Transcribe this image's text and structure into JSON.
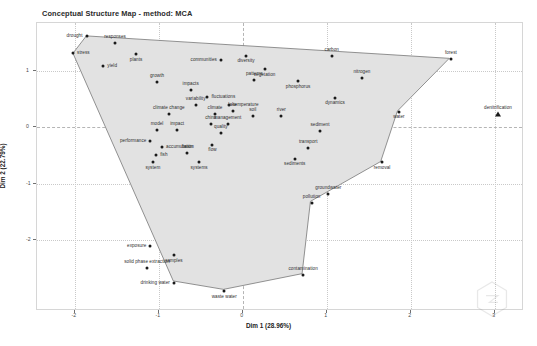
{
  "chart_title": "Conceptual Structure Map - method: MCA",
  "axes": {
    "xlabel": "Dim 1 (28.96%)",
    "ylabel": "Dim 2 (22.79%)",
    "x_ticks": [
      "-2",
      "-1",
      "0",
      "1",
      "2",
      "3"
    ],
    "y_ticks": [
      "1",
      "0",
      "-1",
      "-2"
    ]
  },
  "watermark": "hexagon-logo",
  "chart_data": {
    "type": "scatter",
    "title": "Conceptual Structure Map - method: MCA",
    "xlabel": "Dim 1 (28.96%)",
    "ylabel": "Dim 2 (22.79%)",
    "xlim": [
      -2.45,
      3.35
    ],
    "ylim": [
      -3.25,
      1.85
    ],
    "grid": true,
    "legend": "none",
    "series": [
      {
        "name": "Cluster 1",
        "marker": "circle",
        "points": [
          {
            "label": "drought",
            "x": -1.86,
            "y": 1.62,
            "lpos": "left"
          },
          {
            "label": "responses",
            "x": -1.52,
            "y": 1.5,
            "lpos": "above"
          },
          {
            "label": "stress",
            "x": -2.02,
            "y": 1.31,
            "lpos": "right"
          },
          {
            "label": "plants",
            "x": -1.27,
            "y": 1.3,
            "lpos": "below"
          },
          {
            "label": "yield",
            "x": -1.66,
            "y": 1.09,
            "lpos": "right"
          },
          {
            "label": "communities",
            "x": -0.26,
            "y": 1.19,
            "lpos": "left"
          },
          {
            "label": "diversity",
            "x": 0.04,
            "y": 1.27,
            "lpos": "below"
          },
          {
            "label": "carbon",
            "x": 1.06,
            "y": 1.27,
            "lpos": "above"
          },
          {
            "label": "forest",
            "x": 2.48,
            "y": 1.22,
            "lpos": "above"
          },
          {
            "label": "vegetation",
            "x": 0.26,
            "y": 1.03,
            "lpos": "below"
          },
          {
            "label": "growth",
            "x": -1.02,
            "y": 0.8,
            "lpos": "above"
          },
          {
            "label": "patterns",
            "x": 0.14,
            "y": 0.84,
            "lpos": "above"
          },
          {
            "label": "phosphorus",
            "x": 0.66,
            "y": 0.82,
            "lpos": "below"
          },
          {
            "label": "nitrogen",
            "x": 1.42,
            "y": 0.88,
            "lpos": "above"
          },
          {
            "label": "impacts",
            "x": -0.62,
            "y": 0.66,
            "lpos": "above"
          },
          {
            "label": "fluctuations",
            "x": -0.42,
            "y": 0.54,
            "lpos": "right"
          },
          {
            "label": "dynamics",
            "x": 1.1,
            "y": 0.53,
            "lpos": "below"
          },
          {
            "label": "variability",
            "x": -0.56,
            "y": 0.4,
            "lpos": "above"
          },
          {
            "label": "temperature",
            "x": -0.16,
            "y": 0.4,
            "lpos": "right"
          },
          {
            "label": "water",
            "x": 1.86,
            "y": 0.28,
            "lpos": "below"
          },
          {
            "label": "climate change",
            "x": -0.88,
            "y": 0.24,
            "lpos": "above"
          },
          {
            "label": "climate",
            "x": -0.33,
            "y": 0.24,
            "lpos": "above"
          },
          {
            "label": "lake",
            "x": -0.12,
            "y": 0.29,
            "lpos": "above"
          },
          {
            "label": "soil",
            "x": 0.12,
            "y": 0.21,
            "lpos": "above"
          },
          {
            "label": "river",
            "x": 0.46,
            "y": 0.2,
            "lpos": "above"
          },
          {
            "label": "china",
            "x": -0.38,
            "y": 0.06,
            "lpos": "above"
          },
          {
            "label": "management",
            "x": -0.18,
            "y": 0.07,
            "lpos": "above"
          },
          {
            "label": "model",
            "x": -1.02,
            "y": -0.05,
            "lpos": "above"
          },
          {
            "label": "impact",
            "x": -0.78,
            "y": -0.05,
            "lpos": "above"
          },
          {
            "label": "quality",
            "x": -0.26,
            "y": -0.1,
            "lpos": "above"
          },
          {
            "label": "sediment",
            "x": 0.92,
            "y": -0.06,
            "lpos": "above"
          },
          {
            "label": "performance",
            "x": -1.1,
            "y": -0.24,
            "lpos": "left"
          },
          {
            "label": "accumulation",
            "x": -0.96,
            "y": -0.35,
            "lpos": "right"
          },
          {
            "label": "flow",
            "x": -0.36,
            "y": -0.31,
            "lpos": "below"
          },
          {
            "label": "transport",
            "x": 0.78,
            "y": -0.36,
            "lpos": "above"
          },
          {
            "label": "fish",
            "x": -1.03,
            "y": -0.48,
            "lpos": "right"
          },
          {
            "label": "basin",
            "x": -0.66,
            "y": -0.45,
            "lpos": "above"
          },
          {
            "label": "sediments",
            "x": 0.62,
            "y": -0.55,
            "lpos": "below"
          },
          {
            "label": "system",
            "x": -1.07,
            "y": -0.62,
            "lpos": "below"
          },
          {
            "label": "systems",
            "x": -0.52,
            "y": -0.62,
            "lpos": "below"
          },
          {
            "label": "removal",
            "x": 1.66,
            "y": -0.62,
            "lpos": "below"
          },
          {
            "label": "groundwater",
            "x": 1.02,
            "y": -1.18,
            "lpos": "above"
          },
          {
            "label": "pollution",
            "x": 0.82,
            "y": -1.33,
            "lpos": "above"
          },
          {
            "label": "exposure",
            "x": -1.1,
            "y": -2.1,
            "lpos": "left"
          },
          {
            "label": "samples",
            "x": -0.82,
            "y": -2.26,
            "lpos": "below"
          },
          {
            "label": "solid phase extraction",
            "x": -1.14,
            "y": -2.48,
            "lpos": "above"
          },
          {
            "label": "contamination",
            "x": 0.72,
            "y": -2.62,
            "lpos": "above"
          },
          {
            "label": "drinking water",
            "x": -0.82,
            "y": -2.75,
            "lpos": "left"
          },
          {
            "label": "waste water",
            "x": -0.22,
            "y": -2.9,
            "lpos": "below"
          }
        ]
      },
      {
        "name": "Cluster 2",
        "marker": "triangle",
        "points": [
          {
            "label": "denitrification",
            "x": 3.04,
            "y": 0.24,
            "lpos": "above"
          }
        ]
      }
    ],
    "hull": {
      "fill": "#e2e2e2",
      "stroke": "#777777",
      "vertices": [
        {
          "x": -1.86,
          "y": 1.62
        },
        {
          "x": 2.48,
          "y": 1.22
        },
        {
          "x": 1.86,
          "y": 0.28
        },
        {
          "x": 1.66,
          "y": -0.62
        },
        {
          "x": 0.82,
          "y": -1.33
        },
        {
          "x": 0.72,
          "y": -2.62
        },
        {
          "x": -0.22,
          "y": -2.9
        },
        {
          "x": -0.82,
          "y": -2.75
        },
        {
          "x": -2.02,
          "y": 1.31
        }
      ]
    }
  },
  "colors": {
    "hull_fill": "#e2e2e2",
    "hull_stroke": "#777777",
    "point": "#1a1a1a",
    "grid": "#c9c9c9",
    "text": "#2e2e2e"
  }
}
